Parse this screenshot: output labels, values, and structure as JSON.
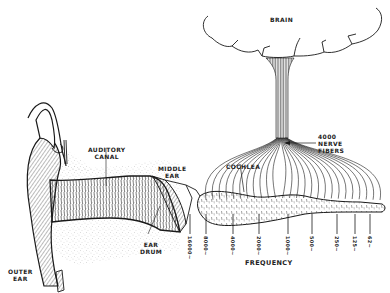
{
  "diagram": {
    "labels": {
      "brain": "BRAIN",
      "nerve_fibers": "4000\nNERVE\nFIBERS",
      "auditory_canal": "AUDITORY\nCANAL",
      "middle_ear": "MIDDLE\nEAR",
      "cochlea": "COCHLEA",
      "ear_drum": "EAR\nDRUM",
      "outer_ear": "OUTER\nEAR",
      "frequency": "FREQUENCY"
    },
    "frequency_ticks": [
      "16000~",
      "8000~",
      "4000~",
      "2000~",
      "1000~",
      "500~",
      "250~",
      "125~",
      "62~"
    ],
    "colors": {
      "ink": "#1a1a1a",
      "paper": "#ffffff",
      "stipple": "#8a8a8a"
    }
  }
}
